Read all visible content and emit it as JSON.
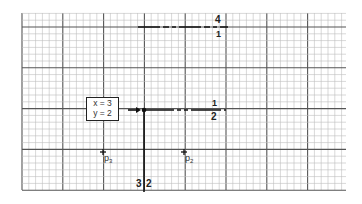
{
  "grid": {
    "left": 22,
    "top": 13,
    "right": 346,
    "bottom": 190,
    "minor_spacing": 6.8,
    "major_every": 6,
    "minor_color": "#bdbdbd",
    "major_color": "#555555"
  },
  "info_box": {
    "line1": "x = 3",
    "line2": "y = 2"
  },
  "current_point": {
    "x": 144,
    "y": 110
  },
  "lines": {
    "top_partition": {
      "label_above": "4",
      "label_below": "1"
    },
    "horizontal_split": {
      "label_above": "1",
      "label_below": "2"
    },
    "vertical_split": {
      "label_left": "3",
      "label_right": "2"
    }
  },
  "points": [
    {
      "name": "p",
      "subscript": "3",
      "x": 103,
      "y": 152
    },
    {
      "name": "p",
      "subscript": "2",
      "x": 184,
      "y": 152
    }
  ]
}
